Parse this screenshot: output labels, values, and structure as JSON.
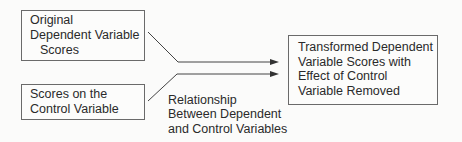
{
  "diagram": {
    "boxes": [
      {
        "id": "original",
        "lines": [
          "Original",
          "Dependent Variable",
          "Scores"
        ]
      },
      {
        "id": "control",
        "lines": [
          "Scores on the",
          "Control Variable"
        ]
      },
      {
        "id": "transformed",
        "lines": [
          "Transformed Dependent",
          "Variable Scores with",
          "Effect of Control",
          "Variable Removed"
        ]
      }
    ],
    "edge_label": [
      "Relationship",
      "Between Dependent",
      "and Control Variables"
    ],
    "colors": {
      "line": "#444444",
      "border": "#6a6a6a",
      "text": "#2a2a2a"
    }
  }
}
